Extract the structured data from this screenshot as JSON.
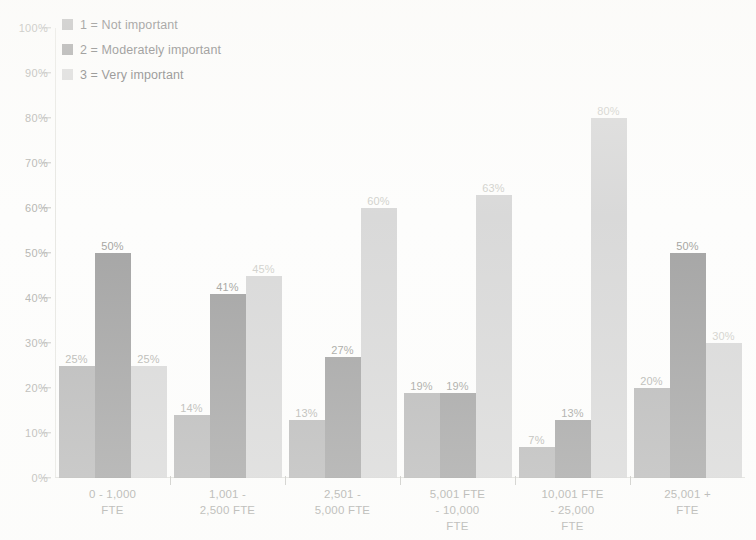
{
  "legend": {
    "items": [
      {
        "label": "1 = Not important",
        "color": "#9d9d9d",
        "swatch_name": "legend-swatch-not-important"
      },
      {
        "label": "2 = Moderately important",
        "color": "#7e7e7e",
        "swatch_name": "legend-swatch-moderately-important"
      },
      {
        "label": "3 = Very important",
        "color": "#cacaca",
        "swatch_name": "legend-swatch-very-important"
      }
    ]
  },
  "yaxis": {
    "ticks": [
      "100%",
      "90%",
      "80%",
      "70%",
      "60%",
      "50%",
      "40%",
      "30%",
      "20%",
      "10%",
      "0%"
    ]
  },
  "xaxis": {
    "labels": [
      "0 - 1,000\nFTE",
      "1,001 -\n2,500 FTE",
      "2,501 -\n5,000 FTE",
      "5,001 FTE\n- 10,000\nFTE",
      "10,001 FTE\n- 25,000\nFTE",
      "25,001 +\nFTE"
    ]
  },
  "bar_labels": {
    "g0": [
      "25%",
      "50%",
      "25%"
    ],
    "g1": [
      "14%",
      "41%",
      "45%"
    ],
    "g2": [
      "13%",
      "27%",
      "60%"
    ],
    "g3": [
      "19%",
      "19%",
      "63%"
    ],
    "g4": [
      "7%",
      "13%",
      "80%"
    ],
    "g5": [
      "20%",
      "50%",
      "30%"
    ]
  },
  "chart_data": {
    "type": "bar",
    "title": "",
    "xlabel": "",
    "ylabel": "",
    "ylim": [
      0,
      100
    ],
    "ytick_step": 10,
    "grid": false,
    "legend_position": "top-left",
    "value_labels": true,
    "categories": [
      "0 - 1,000 FTE",
      "1,001 - 2,500 FTE",
      "2,501 - 5,000 FTE",
      "5,001 FTE - 10,000 FTE",
      "10,001 FTE - 25,000 FTE",
      "25,001 + FTE"
    ],
    "series": [
      {
        "name": "1 = Not important",
        "color": "#9d9d9d",
        "values": [
          25,
          14,
          13,
          19,
          7,
          20
        ]
      },
      {
        "name": "2 = Moderately important",
        "color": "#7e7e7e",
        "values": [
          50,
          41,
          27,
          19,
          13,
          50
        ]
      },
      {
        "name": "3 = Very important",
        "color": "#cacaca",
        "values": [
          25,
          45,
          60,
          63,
          80,
          30
        ]
      }
    ]
  }
}
